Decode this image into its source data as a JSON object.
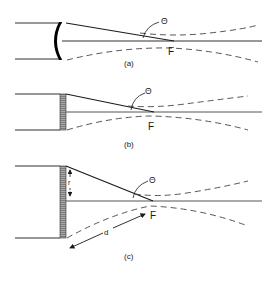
{
  "figure": {
    "panels": [
      {
        "id": "a",
        "caption": "(a)",
        "element": "curved focusing lens",
        "angle_label": "Θ",
        "focus_label": "F"
      },
      {
        "id": "b",
        "caption": "(b)",
        "element": "flat hatched transducer plate",
        "angle_label": "Θ",
        "focus_label": "F"
      },
      {
        "id": "c",
        "caption": "(c)",
        "element": "flat hatched transducer plate",
        "angle_label": "Θ",
        "focus_label": "F",
        "radius_label": "r",
        "distance_label": "d"
      }
    ]
  },
  "colors": {
    "line": "#1a1a1a",
    "dashed": "#444444",
    "hatch_fill": "#9a9a9a",
    "background": "#ffffff"
  }
}
